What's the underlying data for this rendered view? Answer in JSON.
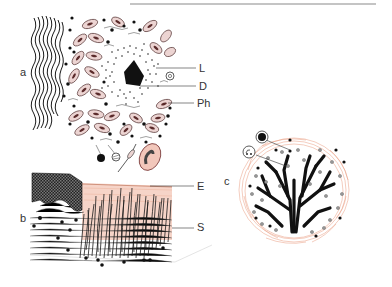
{
  "figure": {
    "panels": [
      {
        "id": "a",
        "label": "a"
      },
      {
        "id": "b",
        "label": "b"
      },
      {
        "id": "c",
        "label": "c"
      }
    ],
    "annotations": {
      "a": [
        {
          "label": "L"
        },
        {
          "label": "D"
        },
        {
          "label": "Ph"
        }
      ],
      "b": [
        {
          "label": "E"
        },
        {
          "label": "S"
        }
      ]
    },
    "colors": {
      "ink": "#1a1a1a",
      "cell_fill": "#ecd4d2",
      "pink_tissue": "#f2c6b6",
      "pink_line": "#e89a7e",
      "rule": "#8a8a8a"
    }
  }
}
